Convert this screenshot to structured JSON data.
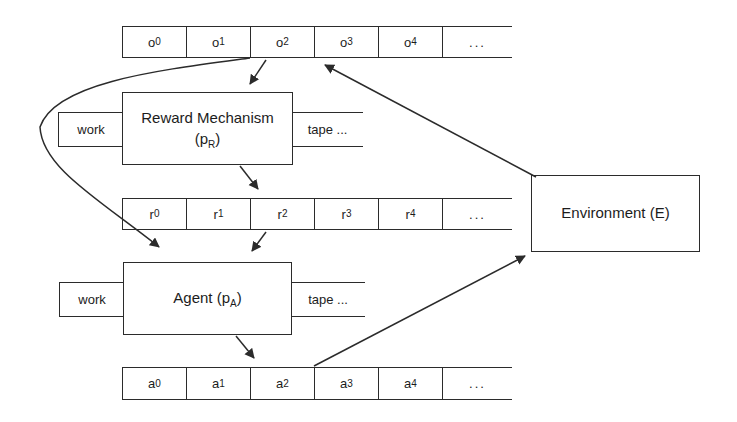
{
  "colors": {
    "background": "#ffffff",
    "line": "#2b2b2b",
    "text": "#1c1c1c"
  },
  "tapes": {
    "observation": {
      "cells": [
        {
          "base": "o",
          "sub": "0"
        },
        {
          "base": "o",
          "sub": "1"
        },
        {
          "base": "o",
          "sub": "2"
        },
        {
          "base": "o",
          "sub": "3"
        },
        {
          "base": "o",
          "sub": "4"
        }
      ],
      "ellipsis": "..."
    },
    "reward": {
      "cells": [
        {
          "base": "r",
          "sub": "0"
        },
        {
          "base": "r",
          "sub": "1"
        },
        {
          "base": "r",
          "sub": "2"
        },
        {
          "base": "r",
          "sub": "3"
        },
        {
          "base": "r",
          "sub": "4"
        }
      ],
      "ellipsis": "..."
    },
    "action": {
      "cells": [
        {
          "base": "a",
          "sub": "0"
        },
        {
          "base": "a",
          "sub": "1"
        },
        {
          "base": "a",
          "sub": "2"
        },
        {
          "base": "a",
          "sub": "3"
        },
        {
          "base": "a",
          "sub": "4"
        }
      ],
      "ellipsis": "..."
    }
  },
  "boxes": {
    "reward_mechanism": {
      "line1": "Reward Mechanism",
      "line2_prefix": "(p",
      "line2_sub": "R",
      "line2_suffix": ")",
      "work_label": "work",
      "tape_label": "tape ..."
    },
    "agent": {
      "label_prefix": "Agent (p",
      "label_sub": "A",
      "label_suffix": ")",
      "work_label": "work",
      "tape_label": "tape ..."
    },
    "environment": {
      "label": "Environment (E)"
    }
  }
}
